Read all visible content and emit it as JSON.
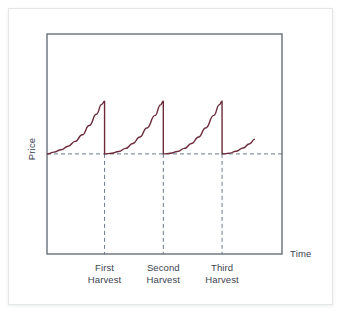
{
  "figure": {
    "price_axis_label": "Price",
    "time_axis_label": "Time",
    "curve_color": "#6b2b3a",
    "frame_color": "#5d6470",
    "guide_color": "#6b7a8d",
    "card_background": "#ffffff"
  },
  "chart_data": {
    "type": "line",
    "title": "",
    "subtitle": "",
    "xlabel": "Time",
    "ylabel": "Price",
    "grid": false,
    "legend": "none",
    "xlim": [
      0,
      100
    ],
    "ylim": [
      0,
      100
    ],
    "axis_ticks": {
      "x_tick_labels": [
        "First Harvest",
        "Second Harvest",
        "Third Harvest"
      ],
      "x_tick_positions": [
        24.5,
        49.5,
        74.5
      ],
      "y_tick_labels": []
    },
    "annotations": [
      {
        "label": "First Harvest",
        "line1": "First",
        "line2": "Harvest",
        "x": 24.5
      },
      {
        "label": "Second Harvest",
        "line1": "Second",
        "line2": "Harvest",
        "x": 49.5
      },
      {
        "label": "Third Harvest",
        "line1": "Third",
        "line2": "Harvest",
        "x": 74.5
      }
    ],
    "reference_lines": [
      {
        "name": "equilibrium-price",
        "orientation": "horizontal",
        "y": 45.5,
        "style": "dashed"
      },
      {
        "name": "first-harvest-dropline",
        "orientation": "vertical",
        "x": 24.5,
        "style": "dashed"
      },
      {
        "name": "second-harvest-dropline",
        "orientation": "vertical",
        "x": 49.5,
        "style": "dashed"
      },
      {
        "name": "third-harvest-dropline",
        "orientation": "vertical",
        "x": 74.5,
        "style": "dashed"
      }
    ],
    "series": [
      {
        "name": "Price",
        "color": "#6b2b3a",
        "description": "Sawtooth cycle: price rises gradually between harvests then drops sharply at each harvest",
        "points": [
          {
            "x": 0.0,
            "y": 45.5
          },
          {
            "x": 3.0,
            "y": 46.3
          },
          {
            "x": 6.0,
            "y": 47.4
          },
          {
            "x": 9.0,
            "y": 49.0
          },
          {
            "x": 12.0,
            "y": 51.2
          },
          {
            "x": 15.0,
            "y": 54.2
          },
          {
            "x": 18.0,
            "y": 58.4
          },
          {
            "x": 21.0,
            "y": 63.5
          },
          {
            "x": 23.3,
            "y": 68.0
          },
          {
            "x": 24.5,
            "y": 69.5
          },
          {
            "x": 24.5,
            "y": 45.5
          },
          {
            "x": 27.5,
            "y": 45.8
          },
          {
            "x": 30.5,
            "y": 46.6
          },
          {
            "x": 33.5,
            "y": 48.0
          },
          {
            "x": 36.5,
            "y": 50.2
          },
          {
            "x": 39.5,
            "y": 53.2
          },
          {
            "x": 42.5,
            "y": 57.3
          },
          {
            "x": 46.0,
            "y": 63.0
          },
          {
            "x": 48.3,
            "y": 67.8
          },
          {
            "x": 49.5,
            "y": 69.5
          },
          {
            "x": 49.5,
            "y": 45.5
          },
          {
            "x": 52.5,
            "y": 45.8
          },
          {
            "x": 55.5,
            "y": 46.6
          },
          {
            "x": 58.5,
            "y": 48.0
          },
          {
            "x": 61.5,
            "y": 50.2
          },
          {
            "x": 64.5,
            "y": 53.2
          },
          {
            "x": 67.5,
            "y": 57.3
          },
          {
            "x": 71.0,
            "y": 63.0
          },
          {
            "x": 73.3,
            "y": 67.8
          },
          {
            "x": 74.5,
            "y": 69.5
          },
          {
            "x": 74.5,
            "y": 45.5
          },
          {
            "x": 77.5,
            "y": 45.8
          },
          {
            "x": 80.5,
            "y": 46.7
          },
          {
            "x": 83.5,
            "y": 48.2
          },
          {
            "x": 86.0,
            "y": 50.0
          },
          {
            "x": 88.5,
            "y": 52.2
          }
        ]
      }
    ]
  }
}
